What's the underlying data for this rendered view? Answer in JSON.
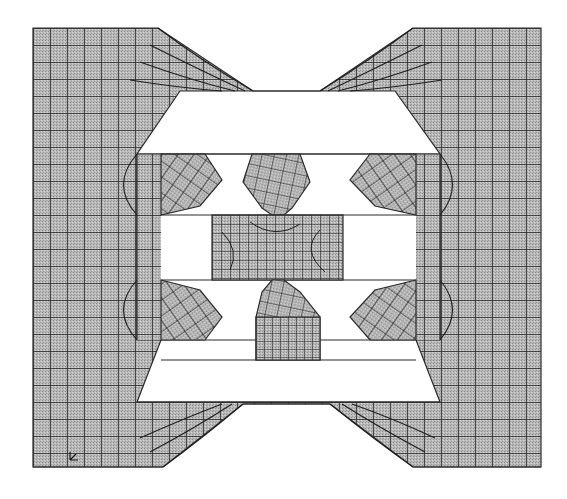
{
  "figure": {
    "colors": {
      "background": "#ffffff",
      "mesh_fill": "#b4b4b4",
      "mesh_line": "#1e1e1e",
      "outline": "#2a2a2a"
    },
    "regions": [
      {
        "name": "outer-body",
        "type": "mesh-region",
        "element_size": 17
      },
      {
        "name": "upper-slot",
        "type": "void"
      },
      {
        "name": "upper-left-notch",
        "type": "mesh-region"
      },
      {
        "name": "upper-center-hexagon",
        "type": "mesh-region"
      },
      {
        "name": "upper-right-notch",
        "type": "mesh-region"
      },
      {
        "name": "center-block",
        "type": "mesh-region",
        "element_size": 9
      },
      {
        "name": "lower-left-notch",
        "type": "mesh-region"
      },
      {
        "name": "lower-center-pentagon",
        "type": "mesh-region"
      },
      {
        "name": "lower-center-block",
        "type": "mesh-region",
        "element_size": 8
      },
      {
        "name": "lower-right-notch",
        "type": "mesh-region"
      },
      {
        "name": "lower-slot",
        "type": "void"
      }
    ],
    "triad_marker": "xy-axis-triad"
  }
}
